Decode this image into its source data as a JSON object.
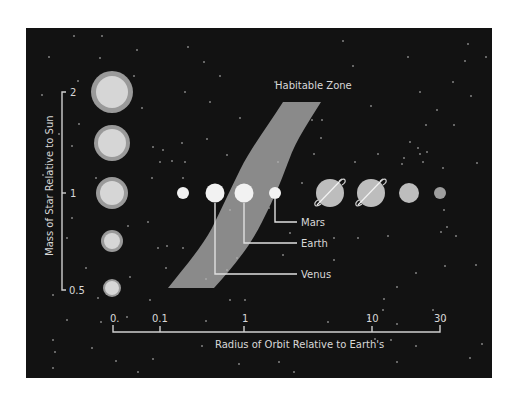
{
  "diagram": {
    "title": "Habitable Zone",
    "y_axis": {
      "label": "Mass of Star Relative to Sun",
      "ticks": [
        {
          "label": "2",
          "y": 92
        },
        {
          "label": "1",
          "y": 193
        },
        {
          "label": "0.5",
          "y": 290
        }
      ]
    },
    "x_axis": {
      "label": "Radius of Orbit Relative to Earth's",
      "ticks": [
        {
          "label": "0.",
          "x": 113
        },
        {
          "label": "0.1",
          "x": 160
        },
        {
          "label": "1",
          "x": 244
        },
        {
          "label": "10",
          "x": 372
        },
        {
          "label": "30",
          "x": 440
        }
      ]
    },
    "stars": [
      {
        "mass": 2,
        "cy": 92,
        "r_outer": 21,
        "r_inner": 16
      },
      {
        "mass": 1.5,
        "cy": 143,
        "r_outer": 18,
        "r_inner": 14
      },
      {
        "mass": 1,
        "cy": 193,
        "r_outer": 16,
        "r_inner": 12
      },
      {
        "mass": 0.75,
        "cy": 241,
        "r_outer": 11,
        "r_inner": 8
      },
      {
        "mass": 0.5,
        "cy": 288,
        "r_outer": 9,
        "r_inner": 7
      }
    ],
    "planets": [
      {
        "name": "Mercury",
        "cx": 183,
        "r": 6,
        "type": "rocky"
      },
      {
        "name": "Venus",
        "cx": 215,
        "r": 9,
        "type": "rocky",
        "labeled": true
      },
      {
        "name": "Earth",
        "cx": 244,
        "r": 9,
        "type": "rocky",
        "labeled": true
      },
      {
        "name": "Mars",
        "cx": 275,
        "r": 6,
        "type": "rocky",
        "labeled": true
      },
      {
        "name": "Jupiter",
        "cx": 330,
        "r": 14,
        "type": "ringed"
      },
      {
        "name": "Saturn",
        "cx": 371,
        "r": 14,
        "type": "ringed"
      },
      {
        "name": "Uranus",
        "cx": 409,
        "r": 10,
        "type": "gas"
      },
      {
        "name": "Neptune",
        "cx": 440,
        "r": 6,
        "type": "gas"
      }
    ],
    "planet_labels": {
      "mars": "Mars",
      "earth": "Earth",
      "venus": "Venus"
    },
    "colors": {
      "background": "#121212",
      "zone": "#8a8a8a",
      "star_outer": "#9a9a9a",
      "star_inner": "#d6d6d6",
      "rocky_planet": "#f2f2f2",
      "gas_planet": "#bdbdbd",
      "far_planet": "#9e9e9e",
      "text": "#d8d8d8"
    }
  }
}
